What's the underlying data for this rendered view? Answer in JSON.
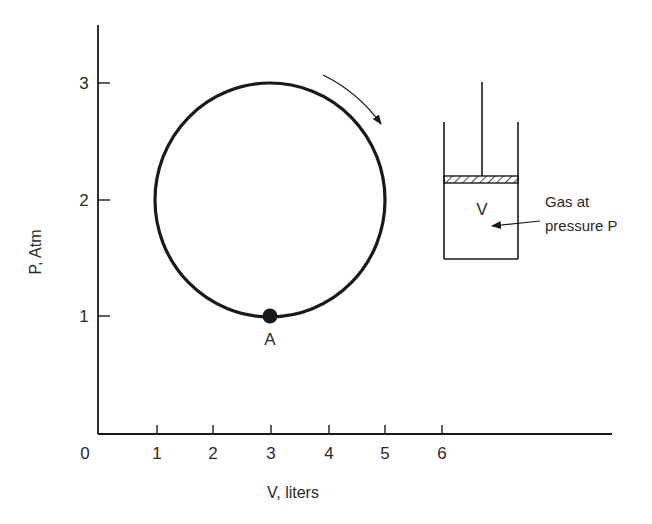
{
  "figure": {
    "x_axis": {
      "label": "V, liters",
      "origin_label": "0",
      "ticks": [
        "1",
        "2",
        "3",
        "4",
        "5",
        "6"
      ]
    },
    "y_axis": {
      "label": "P, Atm",
      "ticks": [
        "1",
        "2",
        "3"
      ]
    },
    "cycle": {
      "shape": "circle",
      "center": {
        "V": 3,
        "P": 2
      },
      "radius_V": 2,
      "radius_P": 1,
      "direction": "clockwise",
      "point_label": "A",
      "point": {
        "V": 3,
        "P": 1
      }
    },
    "cylinder": {
      "volume_label": "V",
      "annotation_line1": "Gas at",
      "annotation_line2": "pressure P"
    },
    "colors": {
      "ink": "#1a1a1a",
      "background": "#ffffff"
    }
  }
}
